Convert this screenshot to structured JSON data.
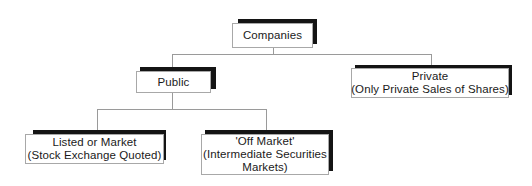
{
  "diagram": {
    "type": "hierarchy",
    "root": {
      "label": "Companies"
    },
    "level1": [
      {
        "label": "Public"
      },
      {
        "line1": "Private",
        "line2": "(Only Private Sales of Shares)"
      }
    ],
    "level2": [
      {
        "line1": "Listed or Market",
        "line2": "(Stock Exchange Quoted)"
      },
      {
        "line1": "'Off Market'",
        "line2": "(Intermediate Securities",
        "line3": "Markets)"
      }
    ],
    "colors": {
      "shadow": "#141414",
      "border": "#a8a8a8",
      "connector": "#9a9a9a",
      "text": "#1a1a1a",
      "background": "#ffffff"
    }
  }
}
